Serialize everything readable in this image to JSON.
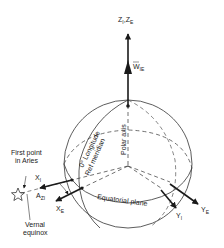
{
  "diagram": {
    "labels": {
      "z_axis": "Z",
      "z_axis_sub1": "I",
      "z_axis_sep": ",",
      "z_axis2": "Z",
      "z_axis_sub2": "E",
      "omega": "W",
      "omega_sub": "IE",
      "polar_axis": "Polar axis",
      "zero_longitude": "0° Longitude",
      "ref_meridian": "Ref meridian",
      "equatorial_plane": "Equatorial plane",
      "first_point_line1": "First point",
      "first_point_line2": "in Aries",
      "vernal_line1": "Vernal",
      "vernal_line2": "equinox",
      "x_inertial": "X",
      "x_inertial_sub": "I",
      "x_earth": "X",
      "x_earth_sub": "E",
      "y_inertial": "Y",
      "y_inertial_sub": "I",
      "y_earth": "Y",
      "y_earth_sub": "E",
      "angle": "A",
      "angle_sub": "ZI"
    },
    "colors": {
      "ink": "#1a1a1a",
      "background": "#ffffff"
    }
  }
}
